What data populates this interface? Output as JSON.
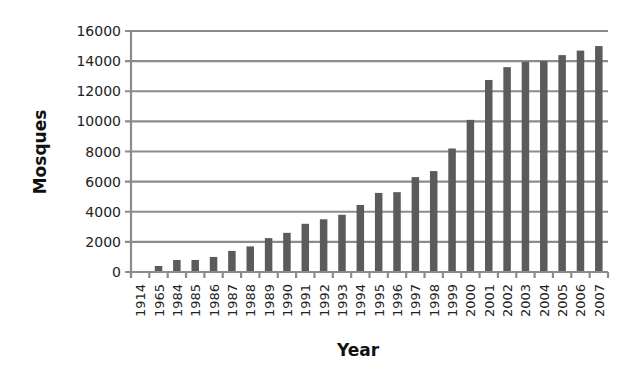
{
  "chart_data": {
    "type": "bar",
    "title": "",
    "xlabel": "Year",
    "ylabel": "Mosques",
    "ylim": [
      0,
      16000
    ],
    "yticks": [
      0,
      2000,
      4000,
      6000,
      8000,
      10000,
      12000,
      14000,
      16000
    ],
    "grid": true,
    "legend": null,
    "categories": [
      "1914",
      "1965",
      "1984",
      "1985",
      "1986",
      "1987",
      "1988",
      "1989",
      "1990",
      "1991",
      "1992",
      "1993",
      "1994",
      "1995",
      "1996",
      "1997",
      "1998",
      "1999",
      "2000",
      "2001",
      "2002",
      "2003",
      "2004",
      "2005",
      "2006",
      "2007"
    ],
    "values": [
      0,
      400,
      800,
      800,
      1000,
      1400,
      1700,
      2250,
      2600,
      3200,
      3500,
      3800,
      4450,
      5250,
      5300,
      6300,
      6700,
      8200,
      10100,
      12750,
      13600,
      13950,
      14000,
      14400,
      14700,
      15000
    ],
    "bar_color": "#5b5b5b",
    "grid_color": "#8c8c8c"
  }
}
